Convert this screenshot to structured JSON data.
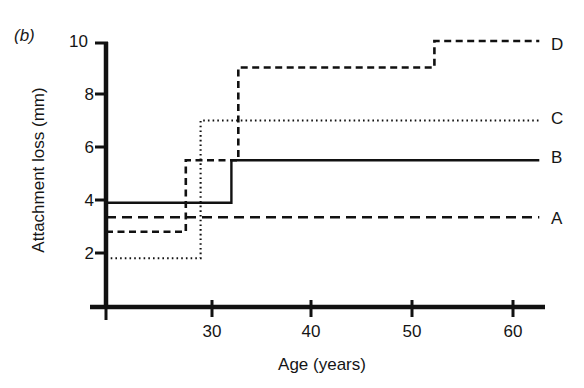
{
  "panel": {
    "label": "(b)"
  },
  "axes": {
    "ylabel": "Attachment loss (mm)",
    "xlabel": "Age (years)",
    "yticks": [
      2,
      4,
      6,
      8,
      10
    ],
    "ytick_labels": [
      "2",
      "4",
      "6",
      "8",
      "10"
    ],
    "xticks": [
      30,
      40,
      50,
      60
    ],
    "xtick_labels": [
      "30",
      "40",
      "50",
      "60"
    ],
    "ylim": [
      0,
      10
    ],
    "xlim": [
      24,
      62.5
    ],
    "grid": false,
    "axis_color": "#111111"
  },
  "legend": {
    "position": "right-inline",
    "entries": [
      {
        "name": "D",
        "label": "D",
        "style": "dashed"
      },
      {
        "name": "C",
        "label": "C",
        "style": "dotted"
      },
      {
        "name": "B",
        "label": "B",
        "style": "solid"
      },
      {
        "name": "A",
        "label": "A",
        "style": "long-dashed"
      }
    ]
  },
  "chart_data": {
    "type": "line",
    "subtype": "step-post",
    "title": "",
    "subtitle": "",
    "xlabel": "Age (years)",
    "ylabel": "Attachment loss (mm)",
    "xlim": [
      24,
      62.5
    ],
    "ylim": [
      0,
      10
    ],
    "xticks": [
      30,
      40,
      50,
      60
    ],
    "yticks": [
      2,
      4,
      6,
      8,
      10
    ],
    "grid": false,
    "legend_position": "right-inline",
    "series": [
      {
        "name": "A",
        "label": "A",
        "style": "long-dashed",
        "color": "#111111",
        "x": [
          24.0,
          62.0
        ],
        "y": [
          3.35,
          3.35
        ],
        "steps": []
      },
      {
        "name": "B",
        "label": "B",
        "style": "solid",
        "color": "#111111",
        "x": [
          24.0,
          35.0,
          35.0,
          62.0
        ],
        "y": [
          3.9,
          3.9,
          5.5,
          5.5
        ],
        "steps": [
          {
            "age": 35.0,
            "from": 3.9,
            "to": 5.5
          }
        ]
      },
      {
        "name": "C",
        "label": "C",
        "style": "dotted",
        "color": "#111111",
        "x": [
          24.0,
          32.3,
          32.3,
          62.0
        ],
        "y": [
          1.8,
          1.8,
          7.0,
          7.0
        ],
        "steps": [
          {
            "age": 32.3,
            "from": 1.8,
            "to": 7.0
          }
        ]
      },
      {
        "name": "D",
        "label": "D",
        "style": "dashed",
        "color": "#111111",
        "x": [
          24.0,
          31.0,
          31.0,
          35.6,
          35.6,
          52.8,
          52.8,
          62.0
        ],
        "y": [
          2.8,
          2.8,
          5.5,
          5.5,
          9.0,
          9.0,
          10.0,
          10.0
        ],
        "steps": [
          {
            "age": 31.0,
            "from": 2.8,
            "to": 5.5
          },
          {
            "age": 35.6,
            "from": 5.5,
            "to": 9.0
          },
          {
            "age": 52.8,
            "from": 9.0,
            "to": 10.0
          }
        ]
      }
    ]
  }
}
